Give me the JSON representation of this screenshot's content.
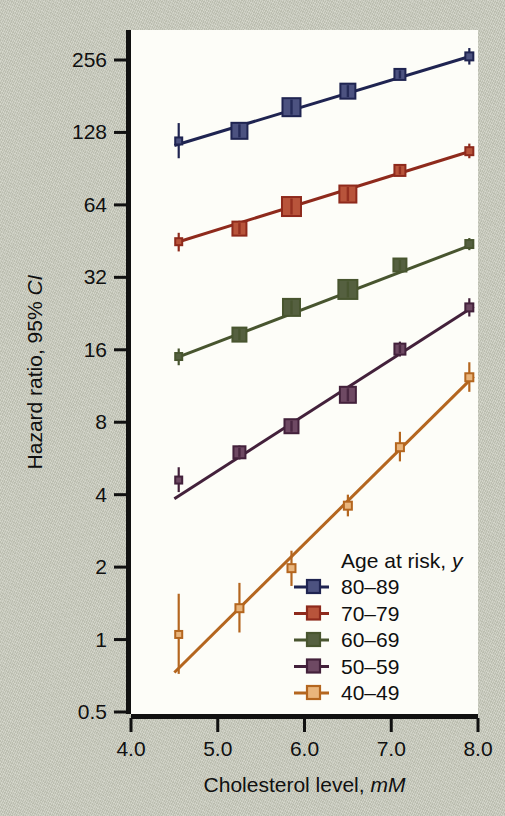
{
  "figure": {
    "background_color": "#c9cbbd",
    "plot_background_color": "#fdfdf8",
    "axis_color": "#111111"
  },
  "chart_data": {
    "type": "line",
    "title": "",
    "subtitle": "",
    "xlabel_main": "Cholesterol level, ",
    "xlabel_italic": "mM",
    "ylabel_main": "Hazard ratio, 95% ",
    "ylabel_italic": "CI",
    "xlim": [
      4.0,
      8.0
    ],
    "ylim": [
      0.5,
      362
    ],
    "yscale": "log2",
    "xticks": [
      "4.0",
      "5.0",
      "6.0",
      "7.0",
      "8.0"
    ],
    "xtick_values": [
      4.0,
      5.0,
      6.0,
      7.0,
      8.0
    ],
    "yticks": [
      "0.5",
      "1",
      "2",
      "4",
      "8",
      "16",
      "32",
      "64",
      "128",
      "256"
    ],
    "ytick_values": [
      0.5,
      1,
      2,
      4,
      8,
      16,
      32,
      64,
      128,
      256
    ],
    "grid": false,
    "legend_position": "bottom-right",
    "legend_title_main": "Age at risk, ",
    "legend_title_italic": "y",
    "x": [
      4.55,
      5.25,
      5.85,
      6.5,
      7.1,
      7.9
    ],
    "series": [
      {
        "name": "80–89",
        "color": "#1f2451",
        "marker_fill": "#4c5280",
        "values": [
          118,
          130,
          163,
          190,
          223,
          265
        ],
        "ci_low": [
          100,
          122,
          152,
          178,
          212,
          245
        ],
        "ci_high": [
          140,
          140,
          176,
          203,
          236,
          287
        ],
        "marker_sizes": [
          7,
          16,
          18,
          15,
          11,
          8
        ]
      },
      {
        "name": "70–79",
        "color": "#8e2a1c",
        "marker_fill": "#b8543b",
        "values": [
          45,
          51,
          63,
          71,
          89,
          107
        ],
        "ci_low": [
          41,
          48,
          59,
          67,
          85,
          100
        ],
        "ci_high": [
          49,
          55,
          68,
          76,
          94,
          115
        ],
        "marker_sizes": [
          7,
          14,
          19,
          17,
          11,
          8
        ]
      },
      {
        "name": "60–69",
        "color": "#48552f",
        "marker_fill": "#556040",
        "values": [
          15,
          18.5,
          24,
          28.5,
          36,
          44
        ],
        "ci_low": [
          13.8,
          17.5,
          22.8,
          27,
          34.4,
          41.5
        ],
        "ci_high": [
          16.2,
          19.6,
          25.3,
          30,
          37.7,
          46.6
        ],
        "marker_sizes": [
          7,
          14,
          17,
          19,
          13,
          8
        ]
      },
      {
        "name": "50–59",
        "color": "#43213b",
        "marker_fill": "#6e4963",
        "values": [
          4.6,
          6.0,
          7.7,
          10.4,
          16.1,
          24
        ],
        "ci_low": [
          4.1,
          5.6,
          7.2,
          9.8,
          15.0,
          22.0
        ],
        "ci_high": [
          5.2,
          6.4,
          8.2,
          11.0,
          17.3,
          26.2
        ],
        "marker_sizes": [
          7,
          12,
          14,
          16,
          11,
          8
        ]
      },
      {
        "name": "40–49",
        "color": "#b4661f",
        "marker_fill": "#e9b57c",
        "values": [
          1.05,
          1.35,
          1.98,
          3.6,
          6.3,
          12.3
        ],
        "ci_low": [
          0.72,
          1.07,
          1.67,
          3.25,
          5.5,
          10.7
        ],
        "ci_high": [
          1.55,
          1.72,
          2.34,
          4.0,
          7.3,
          14.2
        ],
        "marker_sizes": [
          7,
          8,
          8,
          8,
          8,
          8
        ]
      }
    ],
    "fitted_lines": [
      {
        "name": "80–89",
        "x0": 4.5,
        "y0": 113,
        "x1": 7.95,
        "y1": 268
      },
      {
        "name": "70–79",
        "x0": 4.55,
        "y0": 45,
        "x1": 7.95,
        "y1": 108
      },
      {
        "name": "60–69",
        "x0": 4.52,
        "y0": 14.8,
        "x1": 7.95,
        "y1": 44
      },
      {
        "name": "50–59",
        "x0": 4.5,
        "y0": 3.85,
        "x1": 7.95,
        "y1": 24.2
      },
      {
        "name": "40–49",
        "x0": 4.5,
        "y0": 0.73,
        "x1": 7.95,
        "y1": 12.4
      }
    ]
  }
}
